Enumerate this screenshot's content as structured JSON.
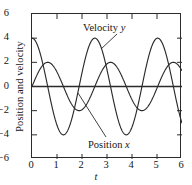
{
  "chart_data": {
    "type": "line",
    "title": "",
    "xlabel": "t",
    "ylabel": "Position and velocity",
    "xlim": [
      0,
      6
    ],
    "ylim": [
      -6,
      6
    ],
    "xticks": [
      0,
      1,
      2,
      3,
      4,
      5,
      6
    ],
    "yticks": [
      -6,
      -4,
      -2,
      0,
      2,
      4,
      6
    ],
    "grid": false,
    "legend_position": "inline-annotations",
    "series": [
      {
        "name": "Position x",
        "label_text": "Position",
        "label_symbol": "x",
        "amplitude": 2,
        "omega": 2.5,
        "phase": 0,
        "form": "sine",
        "color": "#2b2b2b",
        "annotation": {
          "text_x": 88,
          "text_y": 139,
          "leader_from_x": 105,
          "leader_from_y": 136,
          "leader_to_x": 77,
          "leader_to_y": 92
        }
      },
      {
        "name": "Velocity y",
        "label_text": "Velocity",
        "label_symbol": "y",
        "amplitude": 4,
        "omega": 2.5,
        "phase": 0,
        "form": "cosine",
        "color": "#2b2b2b",
        "annotation": {
          "text_x": 83,
          "text_y": 22,
          "leader_from_x": 116,
          "leader_from_y": 33,
          "leader_to_x": 100,
          "leader_to_y": 48
        }
      }
    ],
    "zero_line": true,
    "axis_color": "#2b2b2b"
  }
}
